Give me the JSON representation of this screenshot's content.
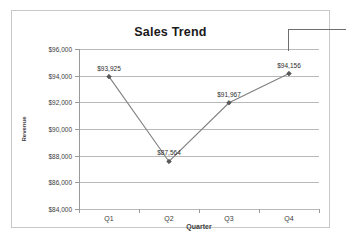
{
  "chart_data": {
    "type": "line",
    "title": "Sales Trend",
    "xlabel": "Quarter",
    "ylabel": "Revenue",
    "categories": [
      "Q1",
      "Q2",
      "Q3",
      "Q4"
    ],
    "values": [
      93925,
      87564,
      91967,
      94156
    ],
    "data_labels": [
      "$93,925",
      "$87,564",
      "$91,967",
      "$94,156"
    ],
    "ylim": [
      84000,
      96000
    ],
    "ytick_values": [
      84000,
      86000,
      88000,
      90000,
      92000,
      94000,
      96000
    ],
    "ytick_labels": [
      "$84,000",
      "$86,000",
      "$88,000",
      "$90,000",
      "$92,000",
      "$94,000",
      "$96,000"
    ],
    "grid": true,
    "legend": false,
    "marker": "diamond",
    "series_color": "#808080",
    "gridline_color": "#b9b9b9",
    "axis_color": "#9a9a9a",
    "border_color": "#c8c8c8",
    "text_color": "#3c3c3c"
  },
  "annotations": {
    "callout_line": "leader-line"
  }
}
